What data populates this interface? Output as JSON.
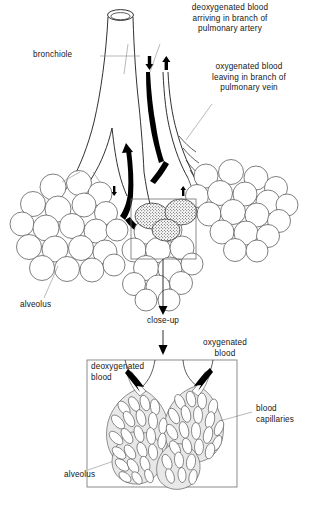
{
  "figure": {
    "background": "#ffffff",
    "ink": "#1a1a1a",
    "vessel_deoxygenated_fill": "#000000",
    "vessel_oxygenated_fill": "#ffffff"
  },
  "labels": {
    "pulmonary_artery": "deoxygenated blood\narriving in branch of\npulmonary artery",
    "pulmonary_vein": "oxygenated blood\nleaving in branch of\npulmonary vein",
    "bronchiole": "bronchiole",
    "alveolus_top": "alveolus",
    "closeup": "close-up",
    "deoxygenated_blood": "deoxygenated\nblood",
    "oxygenated_blood": "oxygenated\nblood",
    "blood_capillaries": "blood\ncapillaries",
    "alveolus_bottom": "alveolus"
  },
  "icons": {
    "arrow_down_artery": "arrow-down-icon",
    "arrow_up_vein": "arrow-up-icon",
    "arrow_down_closeup": "arrow-down-icon",
    "arrow_in_deoxygenated": "arrow-down-right-icon",
    "arrow_out_oxygenated": "arrow-up-right-icon"
  },
  "structures": {
    "bronchiole_tube": "bronchiole",
    "alveoli_cluster_left": "alveoli-cluster",
    "alveoli_cluster_right": "alveoli-cluster",
    "alveoli_cluster_center": "alveoli-cluster",
    "selection_rectangle": "close-up-selection",
    "closeup_panel": "close-up-panel",
    "capillary_network": "capillary-network"
  }
}
